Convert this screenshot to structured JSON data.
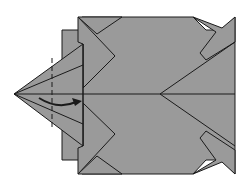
{
  "diagram": {
    "type": "origami-fold-step",
    "colors": {
      "paper": "#9a9a9a",
      "line": "#1a1a1a",
      "background": "#ffffff"
    },
    "instruction_marks": [
      {
        "kind": "valley-fold-dashed-line",
        "orientation": "vertical"
      },
      {
        "kind": "fold-arrow",
        "direction": "right"
      }
    ]
  }
}
